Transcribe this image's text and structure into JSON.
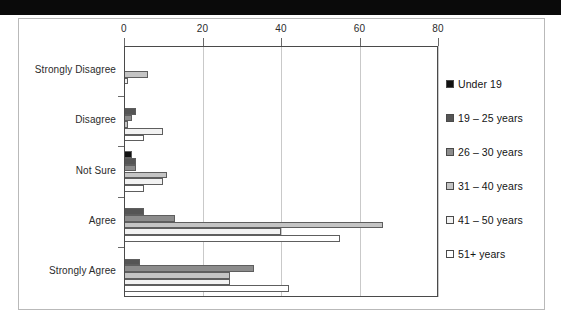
{
  "figure": {
    "scan_artifact": true
  },
  "axis": {
    "x_ticks": [
      "0",
      "20",
      "40",
      "60",
      "80"
    ],
    "y_categories": [
      "Strongly Disagree",
      "Disagree",
      "Not Sure",
      "Agree",
      "Strongly Agree"
    ]
  },
  "legend": {
    "position": "right",
    "items": [
      {
        "label": "Under 19",
        "color": "#111111"
      },
      {
        "label": "19 – 25 years",
        "color": "#555555"
      },
      {
        "label": "26 – 30 years",
        "color": "#8c8c8c"
      },
      {
        "label": "31 – 40 years",
        "color": "#c4c4c4"
      },
      {
        "label": "41 – 50 years",
        "color": "#f2f2f2"
      },
      {
        "label": "51+ years",
        "color": "#ffffff"
      }
    ]
  },
  "chart_data": {
    "type": "bar",
    "orientation": "horizontal",
    "title": "",
    "xlabel": "",
    "ylabel": "",
    "xlim": [
      0,
      80
    ],
    "xticks": [
      0,
      20,
      40,
      60,
      80
    ],
    "grid": true,
    "legend_position": "right",
    "categories": [
      "Strongly Disagree",
      "Disagree",
      "Not Sure",
      "Agree",
      "Strongly Agree"
    ],
    "series": [
      {
        "name": "Under 19",
        "color": "#111111",
        "values": [
          0,
          0,
          2,
          0,
          0
        ]
      },
      {
        "name": "19 – 25 years",
        "color": "#555555",
        "values": [
          0,
          3,
          3,
          5,
          4
        ]
      },
      {
        "name": "26 – 30 years",
        "color": "#8c8c8c",
        "values": [
          0,
          2,
          3,
          13,
          33
        ]
      },
      {
        "name": "31 – 40 years",
        "color": "#c4c4c4",
        "values": [
          6,
          1,
          11,
          66,
          27
        ]
      },
      {
        "name": "41 – 50 years",
        "color": "#f2f2f2",
        "values": [
          1,
          10,
          10,
          40,
          27
        ]
      },
      {
        "name": "51+ years",
        "color": "#ffffff",
        "values": [
          0,
          5,
          5,
          55,
          42
        ]
      }
    ]
  }
}
